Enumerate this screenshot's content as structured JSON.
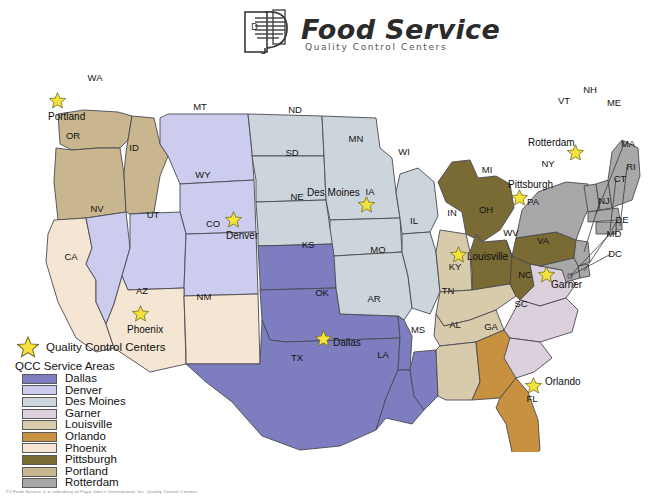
{
  "brand": {
    "logo_name": "pj-monogram-logo",
    "title": "Food Service",
    "subtitle": "Quality Control Centers"
  },
  "legend": {
    "star_label": "Quality Control Centers",
    "heading": "QCC Service Areas",
    "items": [
      {
        "label": "Dallas",
        "color": "#7d7dc0"
      },
      {
        "label": "Denver",
        "color": "#ccccee"
      },
      {
        "label": "Des Moines",
        "color": "#ccd4dc"
      },
      {
        "label": "Garner",
        "color": "#ddd0dd"
      },
      {
        "label": "Louisville",
        "color": "#d8cbac"
      },
      {
        "label": "Orlando",
        "color": "#c8913f"
      },
      {
        "label": "Phoenix",
        "color": "#f4e6d2"
      },
      {
        "label": "Pittsburgh",
        "color": "#7a6a33"
      },
      {
        "label": "Portland",
        "color": "#c9b68e"
      },
      {
        "label": "Rotterdam",
        "color": "#a8a8a8"
      }
    ]
  },
  "map": {
    "star_icon": "star-icon",
    "qcc_centers": [
      {
        "name": "Portland",
        "x": 57,
        "y": 100,
        "label_x": 48,
        "label_y": 117,
        "anchor": "start"
      },
      {
        "name": "Denver",
        "x": 233,
        "y": 219,
        "label_x": 226,
        "label_y": 236,
        "anchor": "start"
      },
      {
        "name": "Phoenix",
        "x": 140,
        "y": 313,
        "label_x": 127,
        "label_y": 330,
        "anchor": "start"
      },
      {
        "name": "Dallas",
        "x": 323,
        "y": 338,
        "label_x": 333,
        "label_y": 343,
        "anchor": "start"
      },
      {
        "name": "Des Moines",
        "x": 366,
        "y": 204,
        "label_x": 307,
        "label_y": 193,
        "anchor": "start"
      },
      {
        "name": "Louisville",
        "x": 458,
        "y": 254,
        "label_x": 467,
        "label_y": 257,
        "anchor": "start"
      },
      {
        "name": "Pittsburgh",
        "x": 519,
        "y": 197,
        "label_x": 508,
        "label_y": 185,
        "anchor": "start"
      },
      {
        "name": "Rotterdam",
        "x": 575,
        "y": 152,
        "label_x": 528,
        "label_y": 143,
        "anchor": "start"
      },
      {
        "name": "Garner",
        "x": 546,
        "y": 274,
        "label_x": 551,
        "label_y": 285,
        "anchor": "start"
      },
      {
        "name": "Orlando",
        "x": 533,
        "y": 385,
        "label_x": 545,
        "label_y": 382,
        "anchor": "start"
      }
    ],
    "state_labels": [
      {
        "code": "WA",
        "x": 95,
        "y": 78,
        "region": "Portland"
      },
      {
        "code": "OR",
        "x": 73,
        "y": 136,
        "region": "Portland"
      },
      {
        "code": "ID",
        "x": 134,
        "y": 148,
        "region": "Portland"
      },
      {
        "code": "MT",
        "x": 200,
        "y": 107,
        "region": "Denver"
      },
      {
        "code": "WY",
        "x": 203,
        "y": 175,
        "region": "Denver"
      },
      {
        "code": "NV",
        "x": 97,
        "y": 209,
        "region": "Denver"
      },
      {
        "code": "UT",
        "x": 153,
        "y": 215,
        "region": "Denver"
      },
      {
        "code": "CO",
        "x": 213,
        "y": 224,
        "region": "Denver"
      },
      {
        "code": "CA",
        "x": 71,
        "y": 257,
        "region": "Phoenix"
      },
      {
        "code": "AZ",
        "x": 142,
        "y": 291,
        "region": "Phoenix"
      },
      {
        "code": "NM",
        "x": 204,
        "y": 297,
        "region": "Phoenix"
      },
      {
        "code": "ND",
        "x": 295,
        "y": 110,
        "region": "Des Moines"
      },
      {
        "code": "SD",
        "x": 292,
        "y": 153,
        "region": "Des Moines"
      },
      {
        "code": "NE",
        "x": 297,
        "y": 197,
        "region": "Des Moines"
      },
      {
        "code": "MN",
        "x": 356,
        "y": 139,
        "region": "Des Moines"
      },
      {
        "code": "IA",
        "x": 370,
        "y": 192,
        "region": "Des Moines"
      },
      {
        "code": "WI",
        "x": 404,
        "y": 152,
        "region": "Des Moines"
      },
      {
        "code": "MO",
        "x": 378,
        "y": 250,
        "region": "Des Moines"
      },
      {
        "code": "IL",
        "x": 414,
        "y": 221,
        "region": "Des Moines"
      },
      {
        "code": "KS",
        "x": 308,
        "y": 245,
        "region": "Dallas"
      },
      {
        "code": "OK",
        "x": 322,
        "y": 293,
        "region": "Dallas"
      },
      {
        "code": "AR",
        "x": 374,
        "y": 299,
        "region": "Dallas"
      },
      {
        "code": "TX",
        "x": 297,
        "y": 358,
        "region": "Dallas"
      },
      {
        "code": "LA",
        "x": 383,
        "y": 355,
        "region": "Dallas"
      },
      {
        "code": "MS",
        "x": 418,
        "y": 330,
        "region": "Dallas"
      },
      {
        "code": "IN",
        "x": 452,
        "y": 213,
        "region": "Louisville"
      },
      {
        "code": "KY",
        "x": 455,
        "y": 267,
        "region": "Louisville"
      },
      {
        "code": "TN",
        "x": 448,
        "y": 291,
        "region": "Louisville"
      },
      {
        "code": "AL",
        "x": 455,
        "y": 325,
        "region": "Louisville"
      },
      {
        "code": "MI",
        "x": 487,
        "y": 170,
        "region": "Pittsburgh"
      },
      {
        "code": "OH",
        "x": 486,
        "y": 210,
        "region": "Pittsburgh"
      },
      {
        "code": "PA",
        "x": 533,
        "y": 202,
        "region": "Pittsburgh"
      },
      {
        "code": "WV",
        "x": 511,
        "y": 233,
        "region": "Pittsburgh"
      },
      {
        "code": "VA",
        "x": 543,
        "y": 241,
        "region": "Garner"
      },
      {
        "code": "NC",
        "x": 525,
        "y": 275,
        "region": "Garner"
      },
      {
        "code": "SC",
        "x": 521,
        "y": 304,
        "region": "Garner"
      },
      {
        "code": "GA",
        "x": 491,
        "y": 327,
        "region": "Orlando"
      },
      {
        "code": "FL",
        "x": 532,
        "y": 399,
        "region": "Orlando"
      },
      {
        "code": "NY",
        "x": 548,
        "y": 164,
        "region": "Rotterdam"
      },
      {
        "code": "VT",
        "x": 564,
        "y": 101,
        "region": "Rotterdam"
      },
      {
        "code": "NH",
        "x": 590,
        "y": 90,
        "region": "Rotterdam"
      },
      {
        "code": "ME",
        "x": 614,
        "y": 103,
        "region": "Rotterdam"
      }
    ],
    "callout_labels": [
      {
        "code": "MA",
        "x": 628,
        "y": 144
      },
      {
        "code": "RI",
        "x": 631,
        "y": 167
      },
      {
        "code": "CT",
        "x": 620,
        "y": 179
      },
      {
        "code": "NJ",
        "x": 604,
        "y": 201
      },
      {
        "code": "DE",
        "x": 622,
        "y": 220
      },
      {
        "code": "MD",
        "x": 614,
        "y": 234
      },
      {
        "code": "DC",
        "x": 615,
        "y": 254
      }
    ]
  },
  "footnote": "PJ Food Service is a subsidiary of Papa John's International, Inc. Quality Control Centers."
}
